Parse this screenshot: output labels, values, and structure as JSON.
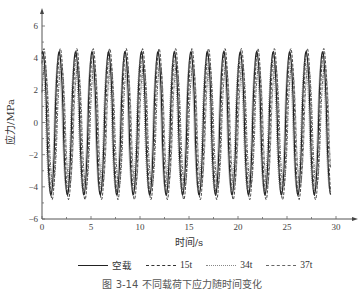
{
  "chart_data": {
    "type": "line",
    "title": "",
    "xlabel": "时间/s",
    "ylabel": "应力/MPa",
    "xlim": [
      0,
      30
    ],
    "ylim": [
      -6,
      6
    ],
    "x_ticks": [
      0,
      5,
      10,
      15,
      20,
      25,
      30
    ],
    "y_ticks": [
      -6,
      -4,
      -2,
      0,
      2,
      4,
      6
    ],
    "grid": false,
    "legend_position": "bottom",
    "signal": {
      "description": "periodic oscillating stress, approximately sinusoidal",
      "period_s": 1.68,
      "cycles_visible": 18,
      "t_start": 0,
      "t_end": 29.5
    },
    "series": [
      {
        "name": "空载",
        "style": "solid",
        "color": "#222222",
        "peak": 4.4,
        "trough": -4.5,
        "phase_s": 0.0
      },
      {
        "name": "15t",
        "style": "dashed",
        "color": "#333333",
        "peak": 4.6,
        "trough": -4.8,
        "phase_s": 0.12
      },
      {
        "name": "34t",
        "style": "dotted",
        "color": "#777777",
        "peak": 3.9,
        "trough": -4.2,
        "phase_s": -0.1
      },
      {
        "name": "37t",
        "style": "dashdot",
        "color": "#555555",
        "peak": 3.6,
        "trough": -4.0,
        "phase_s": 0.22
      }
    ]
  },
  "axes": {
    "x_title": "时间/s",
    "y_title": "应力/MPa"
  },
  "legend": {
    "items": [
      {
        "label": "空载"
      },
      {
        "label": "15t"
      },
      {
        "label": "34t"
      },
      {
        "label": "37t"
      }
    ]
  },
  "caption": "图 3-14 不同载荷下应力随时间变化"
}
